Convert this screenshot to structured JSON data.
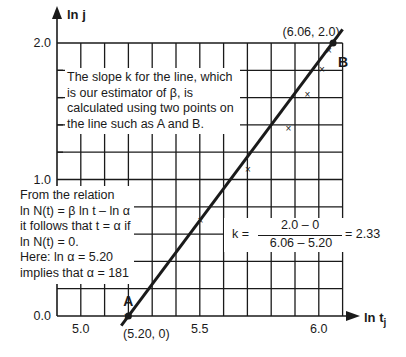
{
  "chart_data": {
    "type": "scatter",
    "title": "",
    "xlabel": "ln t_j",
    "ylabel": "ln j",
    "xlim": [
      4.9,
      6.1
    ],
    "ylim": [
      0.0,
      2.0
    ],
    "x_ticks": [
      "5.0",
      "5.5",
      "6.0"
    ],
    "y_ticks": [
      "0.0",
      "1.0",
      "2.0"
    ],
    "grid": true,
    "series": [
      {
        "name": "observations",
        "marker": "x",
        "x": [
          5.18,
          5.49,
          5.69,
          5.86,
          5.94,
          6.0,
          6.03
        ],
        "y": [
          0.0,
          0.7,
          1.08,
          1.38,
          1.63,
          1.81,
          1.95
        ]
      },
      {
        "name": "fitted line",
        "type": "line",
        "x": [
          5.17,
          6.1
        ],
        "y": [
          -0.07,
          2.1
        ]
      }
    ],
    "points": [
      {
        "label": "A",
        "x": 5.2,
        "y": 0.0,
        "coord_text": "(5.20, 0)"
      },
      {
        "label": "B",
        "x": 6.06,
        "y": 2.0,
        "coord_text": "(6.06, 2.0)"
      }
    ],
    "annotations": {
      "slope_note": [
        "The slope k for the line, which",
        "is our estimator of β, is",
        "calculated using two points on",
        "the line such as A and B."
      ],
      "relation_note": [
        "From the relation",
        "ln N(t) = β ln t – ln α",
        "it follows that t = α if",
        "ln N(t) = 0.",
        "Here: ln α = 5.20",
        "implies that α = 181"
      ],
      "formula": {
        "lhs": "k =",
        "numerator": "2.0 – 0",
        "denominator": "6.06 – 5.20",
        "result": "= 2.33"
      }
    },
    "slope": 2.33,
    "alpha": 181
  }
}
